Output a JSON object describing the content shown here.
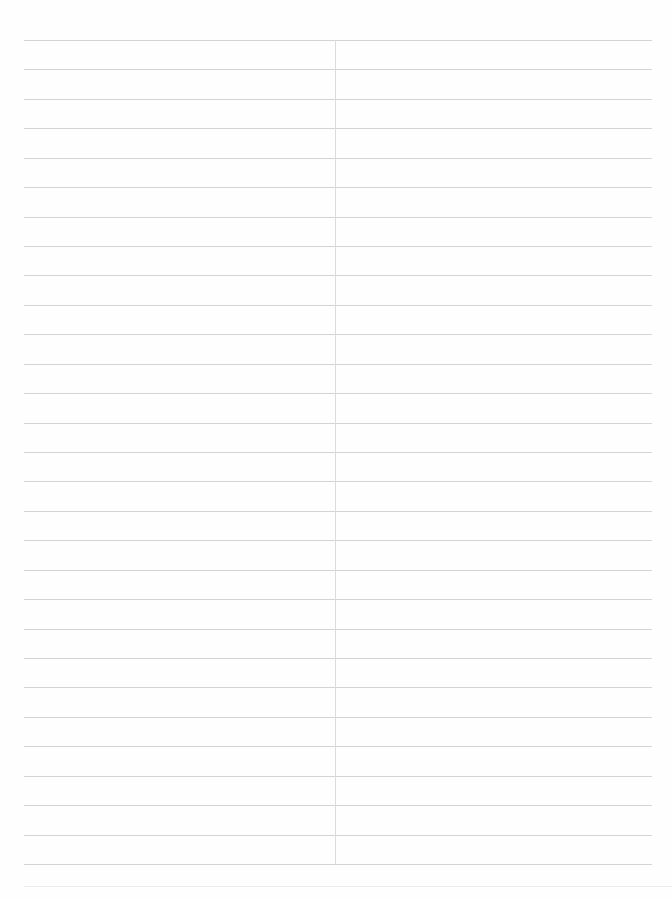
{
  "document": {
    "type": "lined-paper",
    "background_color": "#fefefe",
    "rule_color": "#d4d4d4",
    "faint_rule_color": "#ececec",
    "divider_color": "#dcdcdc",
    "rules": {
      "count": 29,
      "first_y": 40,
      "last_y": 864,
      "left_x": 24,
      "right_x": 652
    },
    "bottom_faint_rule": {
      "y": 886,
      "left_x": 24,
      "right_x": 672
    },
    "center_divider": {
      "x": 335,
      "top_y": 40,
      "bottom_y": 864
    },
    "text": []
  }
}
